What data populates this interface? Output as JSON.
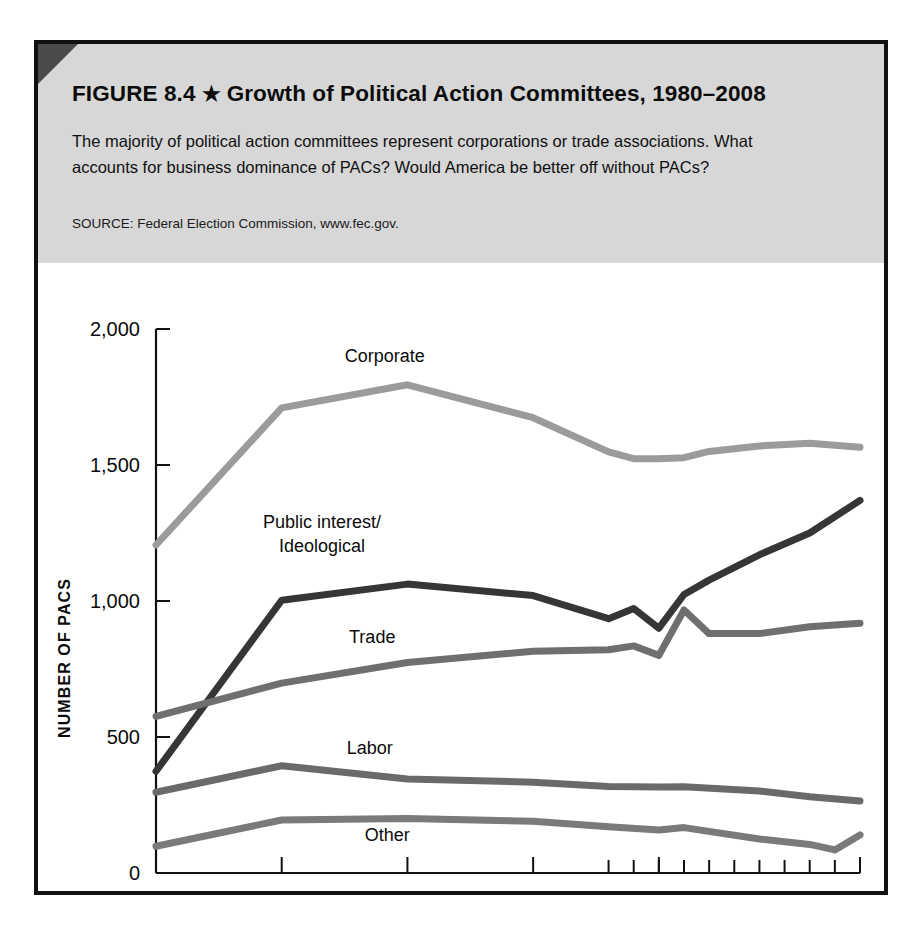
{
  "figure": {
    "number_label": "FIGURE 8.4",
    "star_glyph": "★",
    "title": "Growth of Political Action Committees, 1980–2008",
    "description": "The majority of political action committees represent corporations or trade associations. What accounts for business dominance of PACs? Would America be better off without PACs?",
    "source": "SOURCE: Federal Election Commission, www.fec.gov."
  },
  "colors": {
    "corporate": "#9b9b9b",
    "trade": "#6f6f6f",
    "labor": "#6a6a6a",
    "other": "#7a7a7a",
    "public_interest": "#363636",
    "axis": "#111111",
    "header_band": "#d7d7d7",
    "frame": "#111111"
  },
  "chart_data": {
    "type": "line",
    "title": "Growth of Political Action Committees, 1980–2008",
    "xlabel": "",
    "ylabel": "NUMBER OF PACS",
    "xlim": [
      1980,
      2008
    ],
    "ylim": [
      0,
      2000
    ],
    "grid": false,
    "legend": "inline-labels",
    "x_tick_labels": [
      "1980",
      "1985",
      "1990",
      "1995",
      "2000",
      "2008"
    ],
    "x_tick_values": [
      1980,
      1985,
      1990,
      1995,
      2000,
      2008
    ],
    "x_minor_ticks": [
      1998,
      1999,
      2000,
      2001,
      2002,
      2003,
      2004,
      2005,
      2006,
      2007,
      2008
    ],
    "y_tick_labels": [
      "0",
      "500",
      "1,000",
      "1,500",
      "2,000"
    ],
    "y_tick_values": [
      0,
      500,
      1000,
      1500,
      2000
    ],
    "series": [
      {
        "name": "Corporate",
        "color": "#9b9b9b",
        "label_x": 1989.1,
        "label_y": 1880,
        "x": [
          1980,
          1985,
          1990,
          1995,
          1998,
          1999,
          2000,
          2001,
          2002,
          2004,
          2006,
          2008
        ],
        "values": [
          1206,
          1710,
          1795,
          1674,
          1548,
          1523,
          1523,
          1527,
          1550,
          1570,
          1580,
          1565
        ]
      },
      {
        "name": "Public interest/\nIdeological",
        "label_line1": "Public interest/",
        "label_line2": "Ideological",
        "color": "#363636",
        "label_x": 1986.6,
        "label_y": 1270,
        "x": [
          1980,
          1985,
          1990,
          1995,
          1998,
          1999,
          2000,
          2001,
          2002,
          2004,
          2006,
          2008
        ],
        "values": [
          374,
          1003,
          1062,
          1020,
          935,
          972,
          900,
          1024,
          1077,
          1170,
          1250,
          1370
        ]
      },
      {
        "name": "Trade",
        "color": "#6f6f6f",
        "label_x": 1988.6,
        "label_y": 845,
        "x": [
          1980,
          1985,
          1990,
          1995,
          1998,
          1999,
          2000,
          2001,
          2002,
          2004,
          2006,
          2008
        ],
        "values": [
          576,
          698,
          774,
          815,
          821,
          835,
          800,
          967,
          880,
          880,
          905,
          918
        ]
      },
      {
        "name": "Labor",
        "color": "#6a6a6a",
        "label_x": 1988.5,
        "label_y": 437,
        "x": [
          1980,
          1985,
          1990,
          1995,
          1998,
          2000,
          2001,
          2004,
          2006,
          2008
        ],
        "values": [
          297,
          394,
          346,
          334,
          318,
          316,
          317,
          302,
          280,
          265
        ]
      },
      {
        "name": "Other",
        "color": "#7a7a7a",
        "label_x": 1989.2,
        "label_y": 118,
        "x": [
          1980,
          1985,
          1990,
          1995,
          1998,
          2000,
          2001,
          2004,
          2006,
          2007,
          2008
        ],
        "values": [
          98,
          195,
          200,
          190,
          170,
          158,
          167,
          125,
          105,
          85,
          140
        ]
      }
    ]
  }
}
